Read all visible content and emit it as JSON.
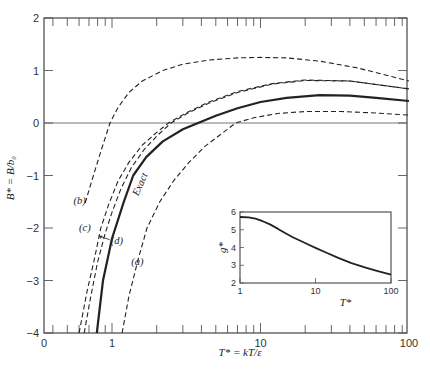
{
  "chart_data": [
    {
      "type": "line",
      "title": "",
      "xlabel": "T* = kT/ε",
      "ylabel": "B* = B/b₀",
      "xscale": "log",
      "xlim": [
        0.35,
        100
      ],
      "ylim": [
        -4,
        2
      ],
      "xticks": [
        {
          "value": 0.35,
          "label": "0"
        },
        {
          "value": 1,
          "label": "1"
        },
        {
          "value": 10,
          "label": "10"
        },
        {
          "value": 100,
          "label": "100"
        }
      ],
      "yticks": [
        {
          "value": 2,
          "label": "2"
        },
        {
          "value": 1,
          "label": "1"
        },
        {
          "value": 0,
          "label": "0"
        },
        {
          "value": -1,
          "label": "−1"
        },
        {
          "value": -2,
          "label": "−2"
        },
        {
          "value": -3,
          "label": "−3"
        },
        {
          "value": -4,
          "label": "−4"
        }
      ],
      "grid": false,
      "zero_line": true,
      "series": [
        {
          "name": "Exact",
          "label": "Exact",
          "style": "solid-bold",
          "x": [
            0.79,
            0.87,
            1.0,
            1.2,
            1.39,
            1.7,
            2.2,
            3.0,
            3.8,
            5,
            7,
            10,
            15,
            25,
            40,
            60,
            100
          ],
          "y": [
            -4.0,
            -3.0,
            -2.2,
            -1.5,
            -1.0,
            -0.65,
            -0.35,
            -0.12,
            0.0,
            0.14,
            0.28,
            0.4,
            0.48,
            0.53,
            0.52,
            0.48,
            0.42
          ]
        },
        {
          "name": "(a)",
          "label": "(a)",
          "style": "dashed",
          "x": [
            1.17,
            1.3,
            1.5,
            1.72,
            2.1,
            2.6,
            3.3,
            4.2,
            5.5,
            6.8,
            9,
            13,
            20,
            35,
            60,
            100
          ],
          "y": [
            -4.0,
            -3.3,
            -2.6,
            -2.0,
            -1.5,
            -1.1,
            -0.75,
            -0.45,
            -0.2,
            0.0,
            0.1,
            0.18,
            0.22,
            0.22,
            0.19,
            0.15
          ]
        },
        {
          "name": "(b)",
          "label": "(b)",
          "style": "dashed",
          "x": [
            0.66,
            0.75,
            0.85,
            0.97,
            1.1,
            1.3,
            1.6,
            2.2,
            3,
            4.5,
            7,
            10,
            15,
            25,
            45,
            100
          ],
          "y": [
            -1.52,
            -1.0,
            -0.5,
            0.0,
            0.3,
            0.58,
            0.8,
            1.0,
            1.12,
            1.2,
            1.24,
            1.25,
            1.24,
            1.18,
            1.05,
            0.8
          ]
        },
        {
          "name": "(c)",
          "label": "(c)",
          "style": "dashed",
          "x": [
            0.6,
            0.68,
            0.76,
            0.84,
            0.95,
            1.1,
            1.3,
            1.6,
            2.0,
            2.4,
            3.2,
            4.5,
            7,
            12,
            20,
            40,
            100
          ],
          "y": [
            -4.0,
            -3.2,
            -2.6,
            -2.0,
            -1.55,
            -1.1,
            -0.75,
            -0.42,
            -0.18,
            0.0,
            0.2,
            0.4,
            0.6,
            0.75,
            0.82,
            0.8,
            0.65
          ]
        },
        {
          "name": "(d)",
          "label": "(d)",
          "style": "dashed",
          "x": [
            0.65,
            0.72,
            0.8,
            0.9,
            1.0,
            1.15,
            1.35,
            1.65,
            2.05,
            2.5,
            3.2,
            4.5,
            7,
            12,
            20,
            40,
            100
          ],
          "y": [
            -4.0,
            -3.3,
            -2.65,
            -2.1,
            -1.7,
            -1.25,
            -0.85,
            -0.5,
            -0.22,
            0.0,
            0.18,
            0.38,
            0.58,
            0.74,
            0.81,
            0.8,
            0.65
          ]
        }
      ],
      "annotations": [
        {
          "text": "Exact",
          "x": 1.5,
          "y": -1.4,
          "rotated": true
        },
        {
          "text": "(a)",
          "x": 1.35,
          "y": -2.7
        },
        {
          "text": "(b)",
          "x": 0.55,
          "y": -1.55
        },
        {
          "text": "(c)",
          "x": 0.6,
          "y": -2.05
        },
        {
          "text": "(d)",
          "x": 0.98,
          "y": -2.3,
          "arrow": true
        }
      ]
    },
    {
      "type": "line",
      "title": "",
      "inset": true,
      "xlabel": "T*",
      "ylabel": "g*",
      "xscale": "log",
      "xlim": [
        1,
        100
      ],
      "ylim": [
        2,
        6
      ],
      "xticks": [
        {
          "value": 1,
          "label": "1"
        },
        {
          "value": 10,
          "label": "10"
        },
        {
          "value": 100,
          "label": "100"
        }
      ],
      "yticks": [
        {
          "value": 2,
          "label": "2"
        },
        {
          "value": 3,
          "label": "3"
        },
        {
          "value": 4,
          "label": "4"
        },
        {
          "value": 5,
          "label": "5"
        },
        {
          "value": 6,
          "label": "6"
        }
      ],
      "series": [
        {
          "name": "g*",
          "style": "solid-bold",
          "x": [
            1,
            1.3,
            1.6,
            2,
            2.5,
            3.2,
            4,
            5,
            6.5,
            8,
            10,
            14,
            20,
            30,
            45,
            65,
            100
          ],
          "y": [
            5.72,
            5.7,
            5.62,
            5.48,
            5.3,
            5.05,
            4.8,
            4.58,
            4.35,
            4.17,
            3.98,
            3.7,
            3.42,
            3.12,
            2.88,
            2.68,
            2.47
          ]
        }
      ]
    }
  ]
}
